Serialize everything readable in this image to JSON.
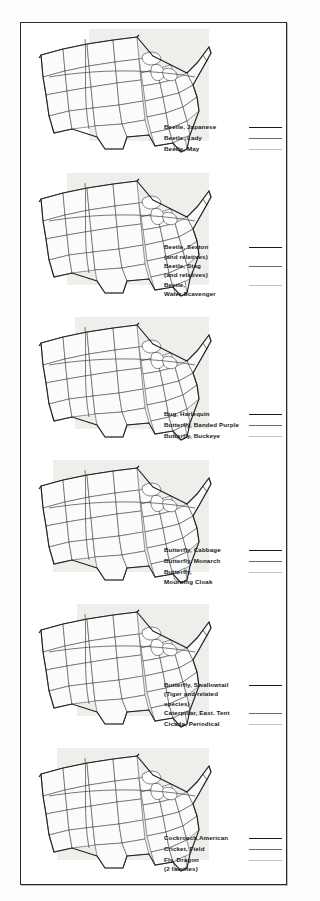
{
  "document": {
    "type": "distribution-map-plate",
    "panel_count": 6,
    "colors": {
      "page_background": "#fdfdfc",
      "frame_border": "#2a2a2a",
      "map_fill": "#fbfbfb",
      "map_shaded_fill": "#e9e9e7",
      "state_outline": "#3a3a3a",
      "coast_outline": "#232323",
      "legend_text": "#15181d",
      "swatch_heavy": "#1b1b1b",
      "swatch_medium": "#6d6d6d",
      "swatch_light": "#c2c2c2"
    }
  },
  "panels": [
    {
      "id": "panel-1",
      "map_name": "united-states-outline-map",
      "legend": [
        {
          "label": "Beetle, Japanese",
          "swatch": "heavy"
        },
        {
          "label": "Beetle, Lady",
          "swatch": "medium"
        },
        {
          "label": "Beetle, May",
          "swatch": "light"
        }
      ]
    },
    {
      "id": "panel-2",
      "map_name": "united-states-outline-map",
      "legend": [
        {
          "label": "Beetle, Sexton\n  (and relatives)",
          "swatch": "heavy"
        },
        {
          "label": "Beetle, Stag\n  (and relatives)",
          "swatch": "medium"
        },
        {
          "label": "Beetle,\n  Water Scavenger",
          "swatch": "light"
        }
      ]
    },
    {
      "id": "panel-3",
      "map_name": "united-states-outline-map",
      "legend": [
        {
          "label": "Bug, Harlequin",
          "swatch": "heavy"
        },
        {
          "label": "Butterfly, Banded Purple",
          "swatch": "medium"
        },
        {
          "label": "Butterfly, Buckeye",
          "swatch": "light"
        }
      ]
    },
    {
      "id": "panel-4",
      "map_name": "united-states-outline-map",
      "legend": [
        {
          "label": "Butterfly, Cabbage",
          "swatch": "heavy"
        },
        {
          "label": "Butterfly, Monarch",
          "swatch": "medium"
        },
        {
          "label": "Butterfly,\n  Mourning Cloak",
          "swatch": "light"
        }
      ]
    },
    {
      "id": "panel-5",
      "map_name": "united-states-outline-map",
      "legend": [
        {
          "label": "Butterfly, Swallowtail\n  (Tiger and related\n    species)",
          "swatch": "heavy"
        },
        {
          "label": "Caterpillar, East. Tent",
          "swatch": "medium"
        },
        {
          "label": "Cicada, Periodical",
          "swatch": "light"
        }
      ]
    },
    {
      "id": "panel-6",
      "map_name": "united-states-outline-map",
      "legend": [
        {
          "label": "Cockroach,American",
          "swatch": "heavy"
        },
        {
          "label": "Cricket, Field",
          "swatch": "medium"
        },
        {
          "label": "Fly, Dragon\n  (2 families)",
          "swatch": "light"
        }
      ]
    }
  ]
}
